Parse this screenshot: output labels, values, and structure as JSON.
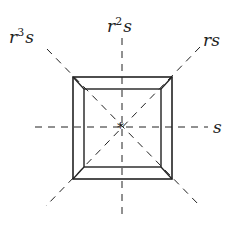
{
  "diagram": {
    "labels": {
      "r3s": {
        "base": "r",
        "sup": "3",
        "tail": "s"
      },
      "r2s": {
        "base": "r",
        "sup": "2",
        "tail": "s"
      },
      "rs": {
        "text": "rs"
      },
      "s": {
        "text": "s"
      }
    },
    "center_mark": "*",
    "colors": {
      "stroke": "#222222",
      "background": "#ffffff"
    }
  }
}
